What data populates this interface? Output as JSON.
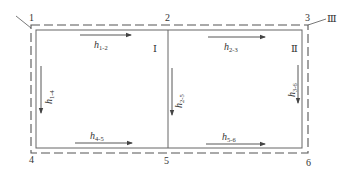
{
  "diagram": {
    "type": "hydraulic pipe network / loop diagram",
    "nodes": [
      {
        "id": "1",
        "label": "1"
      },
      {
        "id": "2",
        "label": "2"
      },
      {
        "id": "3",
        "label": "3"
      },
      {
        "id": "4",
        "label": "4"
      },
      {
        "id": "5",
        "label": "5"
      },
      {
        "id": "6",
        "label": "6"
      }
    ],
    "loops": [
      {
        "id": "I",
        "label": "Ⅰ"
      },
      {
        "id": "II",
        "label": "Ⅱ"
      },
      {
        "id": "III",
        "label": "Ⅲ"
      }
    ],
    "head_losses": [
      {
        "id": "h12",
        "base": "h",
        "sub": "1-2",
        "direction": "right"
      },
      {
        "id": "h23",
        "base": "h",
        "sub": "2-3",
        "direction": "right"
      },
      {
        "id": "h14",
        "base": "h",
        "sub": "1-4",
        "direction": "down"
      },
      {
        "id": "h25",
        "base": "h",
        "sub": "2-5",
        "direction": "down"
      },
      {
        "id": "h36",
        "base": "h",
        "sub": "3-6",
        "direction": "down"
      },
      {
        "id": "h45",
        "base": "h",
        "sub": "4-5",
        "direction": "right"
      },
      {
        "id": "h56",
        "base": "h",
        "sub": "5-6",
        "direction": "right"
      }
    ],
    "colors": {
      "line": "#555555",
      "text": "#333333",
      "background": "#ffffff"
    }
  }
}
